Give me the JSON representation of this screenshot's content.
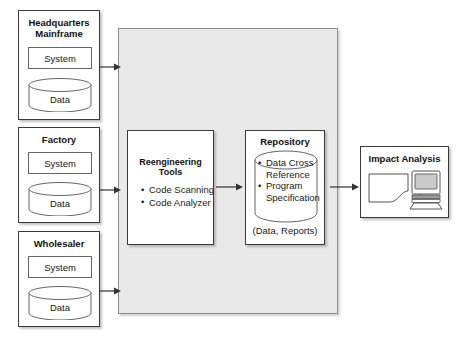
{
  "diagram": {
    "colors": {
      "panel_fill": "#e9e9e9",
      "panel_border": "#8e8e8e",
      "box_border": "#3a3a3a",
      "text": "#1a1a1a",
      "screen_fill": "#c9c9c9"
    }
  },
  "sources": [
    {
      "id": "headquarters",
      "title_line1": "Headquarters",
      "title_line2": "Mainframe",
      "system_label": "System",
      "data_label": "Data"
    },
    {
      "id": "factory",
      "title_line1": "Factory",
      "title_line2": "",
      "system_label": "System",
      "data_label": "Data"
    },
    {
      "id": "wholesaler",
      "title_line1": "Wholesaler",
      "title_line2": "",
      "system_label": "System",
      "data_label": "Data"
    }
  ],
  "reengineering_tools": {
    "title": "Reengineering Tools",
    "bullets": [
      "Code Scanning",
      "Code Analyzer"
    ]
  },
  "repository": {
    "title": "Repository",
    "bullets": [
      "Data Cross Reference",
      "Program Specification"
    ],
    "footer": "(Data, Reports)"
  },
  "impact_analysis": {
    "title": "Impact Analysis",
    "icons": [
      "report-page-icon",
      "computer-monitor-icon"
    ]
  },
  "arrows": [
    {
      "id": "hq-to-panel",
      "from": "headquarters",
      "to": "process-panel"
    },
    {
      "id": "factory-to-panel",
      "from": "factory",
      "to": "process-panel"
    },
    {
      "id": "wholesaler-to-panel",
      "from": "wholesaler",
      "to": "process-panel"
    },
    {
      "id": "tools-to-repository",
      "from": "reengineering_tools",
      "to": "repository"
    },
    {
      "id": "repository-to-impact",
      "from": "repository",
      "to": "impact_analysis"
    }
  ]
}
